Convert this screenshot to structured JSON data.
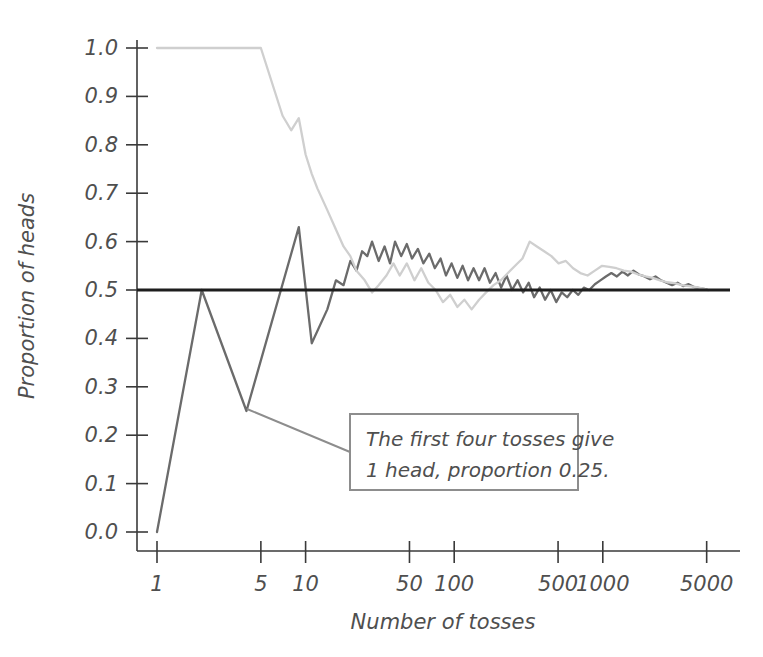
{
  "chart_data": {
    "type": "line",
    "title": "",
    "xlabel": "Number of tosses",
    "ylabel": "Proportion of heads",
    "x_scale": "log",
    "xlim": [
      1,
      5500
    ],
    "ylim": [
      0.0,
      1.0
    ],
    "grid": false,
    "legend": null,
    "x_ticks": [
      1,
      5,
      10,
      50,
      100,
      500,
      1000,
      5000
    ],
    "x_tick_labels": [
      "1",
      "5",
      "10",
      "50",
      "100",
      "500",
      "1000",
      "5000"
    ],
    "y_ticks": [
      0.0,
      0.1,
      0.2,
      0.3,
      0.4,
      0.5,
      0.6,
      0.7,
      0.8,
      0.9,
      1.0
    ],
    "y_tick_labels": [
      "0.0",
      "0.1",
      "0.2",
      "0.3",
      "0.4",
      "0.5",
      "0.6",
      "0.7",
      "0.8",
      "0.9",
      "1.0"
    ],
    "reference_line": {
      "name": "true-probability-0.5",
      "y": 0.5,
      "color": "#1d1d1d",
      "width": 3.2
    },
    "series": [
      {
        "name": "Trial A (dark)",
        "color": "#6b6b6b",
        "width": 2.3,
        "x": [
          1,
          2,
          4,
          9,
          11,
          14,
          16,
          18,
          20,
          22,
          24,
          26,
          28,
          31,
          34,
          37,
          40,
          44,
          48,
          52,
          57,
          62,
          68,
          74,
          81,
          88,
          96,
          105,
          114,
          124,
          135,
          147,
          160,
          174,
          190,
          207,
          225,
          245,
          267,
          291,
          317,
          345,
          376,
          409,
          446,
          486,
          529,
          576,
          628,
          684,
          745,
          811,
          884,
          963,
          1049,
          1142,
          1244,
          1355,
          1476,
          1608,
          1751,
          1907,
          2077,
          2263,
          2465,
          2685,
          2925,
          3186,
          3471,
          3781,
          4118,
          4485,
          4885,
          5100
        ],
        "y": [
          0.0,
          0.5,
          0.25,
          0.63,
          0.39,
          0.46,
          0.52,
          0.51,
          0.56,
          0.54,
          0.58,
          0.57,
          0.6,
          0.56,
          0.59,
          0.555,
          0.6,
          0.57,
          0.595,
          0.565,
          0.585,
          0.555,
          0.575,
          0.545,
          0.565,
          0.53,
          0.555,
          0.525,
          0.55,
          0.52,
          0.545,
          0.52,
          0.545,
          0.515,
          0.535,
          0.505,
          0.53,
          0.5,
          0.52,
          0.495,
          0.515,
          0.485,
          0.505,
          0.48,
          0.5,
          0.475,
          0.495,
          0.485,
          0.5,
          0.49,
          0.505,
          0.5,
          0.512,
          0.52,
          0.528,
          0.535,
          0.528,
          0.538,
          0.53,
          0.54,
          0.532,
          0.528,
          0.522,
          0.528,
          0.52,
          0.515,
          0.51,
          0.515,
          0.508,
          0.512,
          0.506,
          0.504,
          0.502,
          0.5
        ]
      },
      {
        "name": "Trial B (light)",
        "color": "#cfcfcf",
        "width": 2.3,
        "x": [
          1,
          2,
          3,
          4,
          5,
          7,
          8,
          9,
          10,
          11,
          12,
          14,
          16,
          18,
          20,
          22,
          25,
          28,
          31,
          35,
          39,
          43,
          48,
          54,
          60,
          67,
          75,
          84,
          94,
          105,
          117,
          131,
          147,
          164,
          184,
          206,
          230,
          257,
          288,
          322,
          360,
          403,
          451,
          504,
          564,
          631,
          706,
          790,
          884,
          989,
          1106,
          1237,
          1384,
          1548,
          1732,
          1937,
          2167,
          2424,
          2712,
          3034,
          3394,
          3797,
          4248,
          4752,
          5100
        ],
        "y": [
          1.0,
          1.0,
          1.0,
          1.0,
          1.0,
          0.86,
          0.83,
          0.855,
          0.78,
          0.74,
          0.71,
          0.665,
          0.625,
          0.59,
          0.57,
          0.54,
          0.52,
          0.495,
          0.51,
          0.53,
          0.555,
          0.53,
          0.555,
          0.52,
          0.545,
          0.515,
          0.5,
          0.475,
          0.49,
          0.465,
          0.48,
          0.46,
          0.48,
          0.495,
          0.51,
          0.52,
          0.535,
          0.55,
          0.565,
          0.6,
          0.59,
          0.58,
          0.57,
          0.555,
          0.56,
          0.545,
          0.535,
          0.53,
          0.54,
          0.55,
          0.548,
          0.545,
          0.54,
          0.538,
          0.532,
          0.528,
          0.525,
          0.52,
          0.516,
          0.514,
          0.51,
          0.508,
          0.506,
          0.503,
          0.5
        ]
      }
    ],
    "annotations": [
      {
        "name": "first-four-tosses-callout",
        "lines": [
          "The first four tosses give",
          "1 head, proportion 0.25."
        ],
        "points_to": {
          "x": 4,
          "y": 0.25
        },
        "border_color": "#8d8d8d",
        "text_color": "#4f4f4f"
      }
    ]
  },
  "colors": {
    "background": "#ffffff",
    "axis": "#3a3a3a",
    "text": "#4f4f4f",
    "reference": "#1d1d1d",
    "series_dark": "#6b6b6b",
    "series_light": "#cfcfcf",
    "callout_border": "#8d8d8d"
  }
}
